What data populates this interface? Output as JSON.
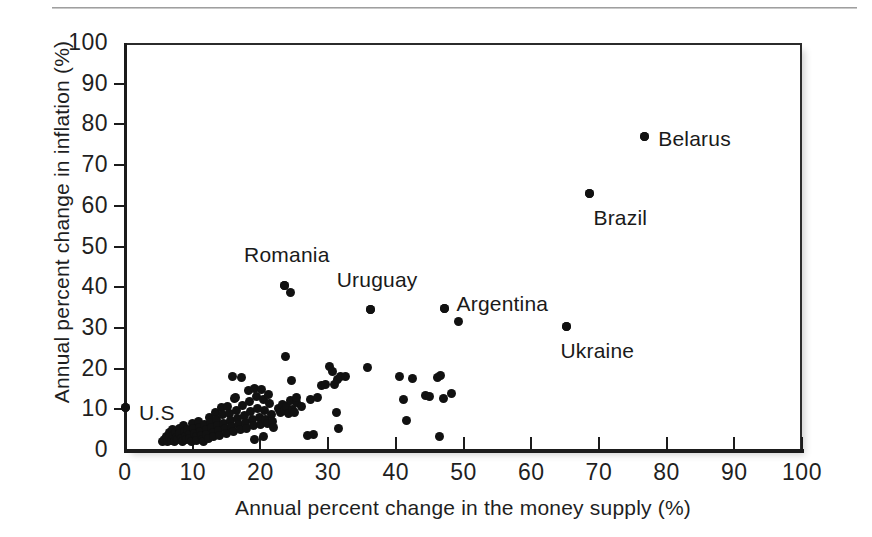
{
  "figure": {
    "top_rule": "horizontal-rule"
  },
  "chart_data": {
    "type": "scatter",
    "title": "",
    "xlabel": "Annual percent change in the money supply (%)",
    "ylabel": "Annual percent change in inflation (%)",
    "xlim": [
      0,
      100
    ],
    "ylim": [
      0,
      100
    ],
    "xticks": [
      0,
      10,
      20,
      30,
      40,
      50,
      60,
      70,
      80,
      90,
      100
    ],
    "yticks": [
      0,
      10,
      20,
      30,
      40,
      50,
      60,
      70,
      80,
      90,
      100
    ],
    "xticklabels": [
      "0",
      "10",
      "20",
      "30",
      "40",
      "50",
      "60",
      "70",
      "80",
      "90",
      "100"
    ],
    "yticklabels": [
      "0",
      "10",
      "20",
      "30",
      "40",
      "50",
      "60",
      "70",
      "80",
      "90",
      "100"
    ],
    "grid": false,
    "legend": null,
    "marker": "filled-circle",
    "marker_color": "#111111",
    "annotations": [
      {
        "label": "U.S",
        "x": 0.0,
        "y": 10.5,
        "text_dx": 14,
        "text_dy": 6
      },
      {
        "label": "Romania",
        "x": 23.5,
        "y": 40.5,
        "text_dx": -40,
        "text_dy": -30
      },
      {
        "label": "Uruguay",
        "x": 36.3,
        "y": 34.5,
        "text_dx": -34,
        "text_dy": -30
      },
      {
        "label": "Argentina",
        "x": 47.2,
        "y": 34.8,
        "text_dx": 12,
        "text_dy": -4
      },
      {
        "label": "Ukraine",
        "x": 65.2,
        "y": 30.3,
        "text_dx": -6,
        "text_dy": 24
      },
      {
        "label": "Brazil",
        "x": 68.6,
        "y": 63.0,
        "text_dx": 4,
        "text_dy": 24
      },
      {
        "label": "Belarus",
        "x": 76.7,
        "y": 77.0,
        "text_dx": 14,
        "text_dy": 2
      }
    ],
    "points": [
      [
        0.0,
        10.5
      ],
      [
        5.6,
        2.0
      ],
      [
        5.9,
        2.6
      ],
      [
        6.1,
        3.4
      ],
      [
        6.3,
        2.1
      ],
      [
        6.5,
        4.2
      ],
      [
        6.6,
        3.0
      ],
      [
        6.8,
        2.4
      ],
      [
        7.0,
        5.0
      ],
      [
        7.1,
        3.6
      ],
      [
        7.3,
        2.2
      ],
      [
        7.5,
        4.4
      ],
      [
        7.6,
        3.1
      ],
      [
        7.8,
        2.6
      ],
      [
        8.0,
        5.4
      ],
      [
        8.1,
        4.0
      ],
      [
        8.3,
        2.9
      ],
      [
        8.5,
        2.2
      ],
      [
        8.6,
        6.0
      ],
      [
        8.8,
        4.6
      ],
      [
        9.0,
        3.4
      ],
      [
        9.1,
        2.5
      ],
      [
        9.3,
        5.1
      ],
      [
        9.5,
        3.9
      ],
      [
        9.6,
        2.8
      ],
      [
        9.8,
        2.1
      ],
      [
        10.0,
        6.4
      ],
      [
        10.1,
        5.2
      ],
      [
        10.3,
        4.1
      ],
      [
        10.5,
        3.2
      ],
      [
        10.6,
        2.4
      ],
      [
        10.8,
        7.0
      ],
      [
        11.0,
        5.6
      ],
      [
        11.1,
        4.5
      ],
      [
        11.3,
        3.5
      ],
      [
        11.5,
        2.6
      ],
      [
        11.6,
        2.0
      ],
      [
        11.8,
        6.2
      ],
      [
        12.0,
        5.0
      ],
      [
        12.1,
        3.8
      ],
      [
        12.3,
        2.9
      ],
      [
        12.5,
        8.1
      ],
      [
        12.6,
        6.8
      ],
      [
        12.8,
        5.5
      ],
      [
        13.0,
        4.2
      ],
      [
        13.1,
        3.3
      ],
      [
        13.3,
        9.2
      ],
      [
        13.5,
        7.4
      ],
      [
        13.6,
        6.0
      ],
      [
        13.8,
        4.8
      ],
      [
        14.0,
        3.6
      ],
      [
        14.2,
        10.4
      ],
      [
        14.4,
        8.6
      ],
      [
        14.6,
        6.6
      ],
      [
        14.8,
        5.2
      ],
      [
        15.0,
        4.0
      ],
      [
        15.2,
        10.8
      ],
      [
        15.4,
        9.0
      ],
      [
        15.6,
        7.2
      ],
      [
        15.8,
        5.8
      ],
      [
        16.0,
        4.6
      ],
      [
        16.2,
        12.6
      ],
      [
        16.4,
        9.8
      ],
      [
        16.6,
        7.8
      ],
      [
        16.8,
        6.2
      ],
      [
        17.0,
        5.0
      ],
      [
        17.2,
        17.9
      ],
      [
        17.4,
        11.0
      ],
      [
        17.6,
        8.4
      ],
      [
        17.8,
        6.8
      ],
      [
        18.0,
        5.4
      ],
      [
        18.2,
        14.5
      ],
      [
        18.4,
        12.0
      ],
      [
        18.6,
        9.4
      ],
      [
        18.8,
        7.4
      ],
      [
        19.0,
        5.9
      ],
      [
        19.2,
        15.2
      ],
      [
        19.4,
        13.2
      ],
      [
        19.6,
        10.2
      ],
      [
        19.8,
        8.0
      ],
      [
        20.0,
        6.3
      ],
      [
        20.2,
        14.8
      ],
      [
        20.4,
        12.4
      ],
      [
        20.6,
        9.6
      ],
      [
        20.8,
        7.6
      ],
      [
        21.0,
        6.6
      ],
      [
        21.2,
        13.6
      ],
      [
        21.4,
        11.4
      ],
      [
        21.6,
        8.8
      ],
      [
        21.8,
        7.0
      ],
      [
        22.0,
        5.6
      ],
      [
        15.9,
        18.0
      ],
      [
        19.2,
        2.6
      ],
      [
        20.4,
        3.2
      ],
      [
        16.3,
        12.8
      ],
      [
        23.5,
        40.5
      ],
      [
        24.5,
        38.8
      ],
      [
        22.6,
        10.3
      ],
      [
        22.9,
        9.1
      ],
      [
        23.2,
        11.2
      ],
      [
        23.5,
        9.8
      ],
      [
        23.8,
        10.6
      ],
      [
        24.1,
        8.9
      ],
      [
        24.4,
        12.2
      ],
      [
        24.7,
        10.0
      ],
      [
        25.0,
        9.3
      ],
      [
        25.3,
        11.6
      ],
      [
        23.7,
        23.0
      ],
      [
        24.6,
        17.1
      ],
      [
        25.4,
        12.9
      ],
      [
        26.0,
        10.8
      ],
      [
        27.0,
        3.6
      ],
      [
        27.8,
        3.9
      ],
      [
        27.4,
        12.4
      ],
      [
        28.4,
        12.9
      ],
      [
        29.0,
        15.8
      ],
      [
        29.6,
        16.2
      ],
      [
        30.2,
        20.4
      ],
      [
        30.6,
        19.2
      ],
      [
        31.0,
        16.0
      ],
      [
        31.4,
        17.4
      ],
      [
        31.8,
        18.0
      ],
      [
        31.2,
        9.2
      ],
      [
        31.6,
        5.3
      ],
      [
        32.6,
        18.1
      ],
      [
        36.3,
        34.5
      ],
      [
        35.8,
        20.2
      ],
      [
        40.6,
        18.0
      ],
      [
        41.2,
        12.3
      ],
      [
        41.6,
        7.3
      ],
      [
        42.4,
        17.6
      ],
      [
        44.4,
        13.3
      ],
      [
        45.0,
        13.1
      ],
      [
        46.2,
        17.9
      ],
      [
        46.6,
        18.4
      ],
      [
        47.0,
        12.6
      ],
      [
        48.2,
        13.8
      ],
      [
        46.4,
        3.4
      ],
      [
        47.2,
        34.8
      ],
      [
        49.3,
        31.5
      ],
      [
        65.2,
        30.3
      ],
      [
        68.6,
        63.0
      ],
      [
        76.7,
        77.0
      ]
    ]
  }
}
